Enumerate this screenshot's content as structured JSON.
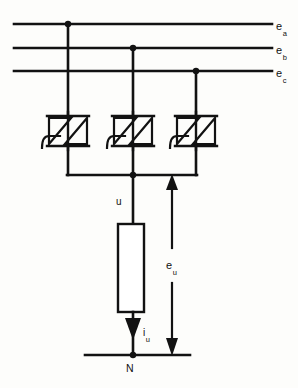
{
  "figure": {
    "stroke_color": "#121212",
    "background_color": "#fdfdfb"
  },
  "labels": {
    "phase_a": {
      "base": "e",
      "sub": "a"
    },
    "phase_b": {
      "base": "e",
      "sub": "b"
    },
    "phase_c": {
      "base": "e",
      "sub": "c"
    },
    "node_u": {
      "base": "u",
      "sub": ""
    },
    "source_voltage_u": {
      "base": "e",
      "sub": "u"
    },
    "load_current_u": {
      "base": "i",
      "sub": "u"
    },
    "neutral": {
      "base": "N",
      "sub": ""
    }
  },
  "components": {
    "bus_lines": [
      {
        "name": "line-ea",
        "y": 24,
        "x1": 14,
        "x2": 272
      },
      {
        "name": "line-eb",
        "y": 48,
        "x1": 14,
        "x2": 272
      },
      {
        "name": "line-ec",
        "y": 71,
        "x1": 14,
        "x2": 272
      }
    ],
    "junction_dots": [
      {
        "name": "dot-a",
        "x": 68,
        "y": 24
      },
      {
        "name": "dot-b",
        "x": 133,
        "y": 48
      },
      {
        "name": "dot-c",
        "x": 196,
        "y": 71
      },
      {
        "name": "dot-u",
        "x": 133,
        "y": 175
      },
      {
        "name": "dot-n",
        "x": 133,
        "y": 355
      }
    ],
    "thyristor_pairs": [
      {
        "name": "triac-a",
        "x": 68,
        "y": 131,
        "phase": "a"
      },
      {
        "name": "triac-b",
        "x": 133,
        "y": 131,
        "phase": "b"
      },
      {
        "name": "triac-c",
        "x": 196,
        "y": 131,
        "phase": "c"
      }
    ],
    "common_rail": {
      "name": "common-rail",
      "y": 175,
      "x1": 68,
      "x2": 196
    },
    "load": {
      "name": "load-resistor",
      "x": 118,
      "y": 224,
      "width": 26,
      "height": 88
    },
    "neutral_rail": {
      "name": "neutral-rail",
      "y": 355,
      "x1": 85,
      "x2": 190
    },
    "voltage_arrow": {
      "name": "eu-arrow",
      "x": 172,
      "y_top": 175,
      "y_bottom": 355,
      "style": "double-headed"
    },
    "current_arrow": {
      "name": "iu-arrow",
      "x": 133,
      "y_top": 316,
      "y_bottom": 340,
      "direction": "down"
    }
  }
}
